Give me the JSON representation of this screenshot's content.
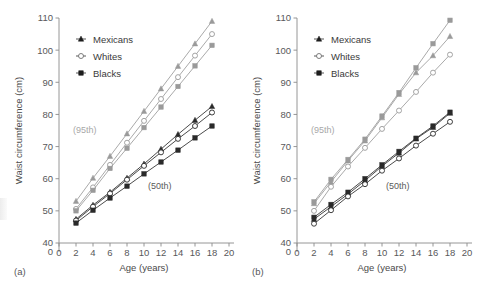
{
  "figure": {
    "panels": [
      {
        "id": "a",
        "panel_label": "(a)",
        "annotations": [
          {
            "name": "percentile-95-label",
            "text": "(95th)"
          },
          {
            "name": "percentile-50-label",
            "text": "(50th)"
          }
        ]
      },
      {
        "id": "b",
        "panel_label": "(b)",
        "annotations": [
          {
            "name": "percentile-95-label",
            "text": "(95th)"
          },
          {
            "name": "percentile-50-label",
            "text": "(50th)"
          }
        ]
      }
    ],
    "legend": {
      "entries": [
        {
          "label": "Mexicans",
          "marker": "triangle",
          "color": "#1d1d1d"
        },
        {
          "label": "Whites",
          "marker": "circle-open",
          "color": "#6f6f6f"
        },
        {
          "label": "Blacks",
          "marker": "square",
          "color": "#1d1d1d"
        }
      ]
    }
  },
  "chart_data": [
    {
      "type": "line",
      "panel": "a",
      "title": "",
      "xlabel": "Age (years)",
      "ylabel": "Waist circumference (cm)",
      "xlim": [
        0,
        20
      ],
      "ylim": [
        40,
        110
      ],
      "xticks": [
        0,
        2,
        4,
        6,
        8,
        10,
        12,
        14,
        16,
        18,
        20
      ],
      "yticks": [
        40,
        50,
        60,
        70,
        80,
        90,
        100,
        110
      ],
      "y_axis_break_label": "0",
      "grid": false,
      "legend_position": "upper-left-inside",
      "x": [
        2,
        4,
        6,
        8,
        10,
        12,
        14,
        16,
        18
      ],
      "series": [
        {
          "name": "Mexicans (95th)",
          "group": "95th",
          "marker": "triangle",
          "color": "#9a9a9a",
          "values": [
            53.0,
            60.2,
            67.0,
            74.0,
            81.0,
            88.0,
            95.0,
            102.0,
            109.0
          ]
        },
        {
          "name": "Whites (95th)",
          "group": "95th",
          "marker": "circle-open",
          "color": "#9a9a9a",
          "values": [
            50.6,
            57.3,
            64.3,
            71.2,
            78.0,
            84.8,
            91.6,
            98.3,
            105.0
          ]
        },
        {
          "name": "Blacks (95th)",
          "group": "95th",
          "marker": "square",
          "color": "#9a9a9a",
          "values": [
            50.0,
            56.4,
            63.2,
            69.5,
            75.9,
            82.3,
            88.7,
            95.1,
            101.5
          ]
        },
        {
          "name": "Mexicans (50th)",
          "group": "50th",
          "marker": "triangle",
          "color": "#2a2a2a",
          "values": [
            47.4,
            51.8,
            55.8,
            60.2,
            64.6,
            69.2,
            73.8,
            78.2,
            82.5
          ]
        },
        {
          "name": "Whites (50th)",
          "group": "50th",
          "marker": "circle-open",
          "color": "#2a2a2a",
          "values": [
            47.0,
            51.3,
            55.4,
            59.7,
            64.0,
            68.2,
            72.4,
            76.4,
            80.6
          ]
        },
        {
          "name": "Blacks (50th)",
          "group": "50th",
          "marker": "square",
          "color": "#2a2a2a",
          "values": [
            46.2,
            50.2,
            54.0,
            57.7,
            61.5,
            65.2,
            68.9,
            72.7,
            76.4
          ]
        }
      ]
    },
    {
      "type": "line",
      "panel": "b",
      "title": "",
      "xlabel": "Age (years)",
      "ylabel": "Waist circumference (cm)",
      "xlim": [
        0,
        20
      ],
      "ylim": [
        40,
        110
      ],
      "xticks": [
        0,
        2,
        4,
        6,
        8,
        10,
        12,
        14,
        16,
        18,
        20
      ],
      "yticks": [
        40,
        50,
        60,
        70,
        80,
        90,
        100,
        110
      ],
      "y_axis_break_label": "0",
      "grid": false,
      "legend_position": "upper-left-inside",
      "x": [
        2,
        4,
        6,
        8,
        10,
        12,
        14,
        16,
        18
      ],
      "series": [
        {
          "name": "Blacks (95th)",
          "group": "95th",
          "marker": "square",
          "color": "#9a9a9a",
          "values": [
            52.8,
            59.8,
            66.0,
            72.3,
            79.5,
            86.8,
            94.5,
            102.0,
            109.3
          ]
        },
        {
          "name": "Mexicans (95th)",
          "group": "95th",
          "marker": "triangle",
          "color": "#9a9a9a",
          "values": [
            52.3,
            59.0,
            65.6,
            71.8,
            79.0,
            86.3,
            93.0,
            98.3,
            104.3
          ]
        },
        {
          "name": "Whites (95th)",
          "group": "95th",
          "marker": "circle-open",
          "color": "#9a9a9a",
          "values": [
            50.0,
            57.5,
            63.8,
            69.6,
            75.5,
            81.2,
            87.0,
            93.0,
            98.6
          ]
        },
        {
          "name": "Blacks (50th)",
          "group": "50th",
          "marker": "square",
          "color": "#2a2a2a",
          "values": [
            48.0,
            52.0,
            55.8,
            60.0,
            64.3,
            68.5,
            72.6,
            76.4,
            80.7
          ]
        },
        {
          "name": "Mexicans (50th)",
          "group": "50th",
          "marker": "triangle",
          "color": "#2a2a2a",
          "values": [
            47.4,
            51.3,
            55.2,
            59.4,
            63.9,
            68.0,
            72.4,
            76.0,
            80.4
          ]
        },
        {
          "name": "Whites (50th)",
          "group": "50th",
          "marker": "circle-open",
          "color": "#2a2a2a",
          "values": [
            46.0,
            50.2,
            54.5,
            58.3,
            62.5,
            66.3,
            70.3,
            74.0,
            77.7
          ]
        }
      ]
    }
  ]
}
